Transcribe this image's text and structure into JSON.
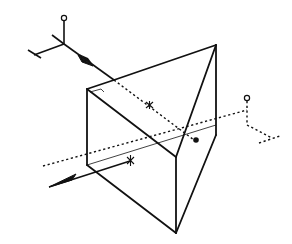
{
  "diagram": {
    "type": "optical-prism-ray-diagram",
    "colors": {
      "line": "#111111",
      "background": "#ffffff"
    },
    "elements": {
      "prism": "right-angle-prism",
      "incident_ray": "arrow-in",
      "exit_ray": "arrow-out",
      "entry_axes": "coordinate-axes-solid",
      "exit_axes": "coordinate-axes-dashed",
      "entry_point_marker": "asterisk",
      "exit_point_marker": "asterisk",
      "reflection_point_marker": "dot",
      "right_angle_marker": "square-corner"
    }
  }
}
